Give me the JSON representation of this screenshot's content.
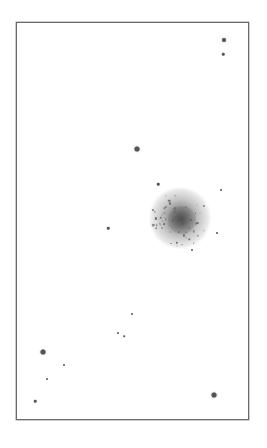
{
  "image": {
    "description": "Inverted (negative) astronomical star field showing a globular cluster inside a rectangular frame",
    "background_color": "#ffffff",
    "frame_color": "#6a6a6a",
    "star_color": "#555555"
  },
  "frame": {
    "left": 16,
    "top": 22,
    "right": 249,
    "bottom": 420
  },
  "cluster": {
    "x": 180,
    "y": 218,
    "radius": 30,
    "core_radius": 14
  },
  "stars": [
    {
      "x": 224,
      "y": 40,
      "size": 4
    },
    {
      "x": 223,
      "y": 54,
      "size": 2.5
    },
    {
      "x": 137,
      "y": 149,
      "size": 5
    },
    {
      "x": 158,
      "y": 184,
      "size": 2.5
    },
    {
      "x": 221,
      "y": 190,
      "size": 2
    },
    {
      "x": 217,
      "y": 233,
      "size": 2
    },
    {
      "x": 108,
      "y": 228,
      "size": 2.5
    },
    {
      "x": 192,
      "y": 250,
      "size": 2
    },
    {
      "x": 132,
      "y": 314,
      "size": 2
    },
    {
      "x": 118,
      "y": 333,
      "size": 2
    },
    {
      "x": 124,
      "y": 336,
      "size": 1.5
    },
    {
      "x": 43,
      "y": 352,
      "size": 5
    },
    {
      "x": 64,
      "y": 365,
      "size": 2
    },
    {
      "x": 47,
      "y": 379,
      "size": 2
    },
    {
      "x": 35,
      "y": 401,
      "size": 2.5
    },
    {
      "x": 214,
      "y": 395,
      "size": 5
    }
  ]
}
